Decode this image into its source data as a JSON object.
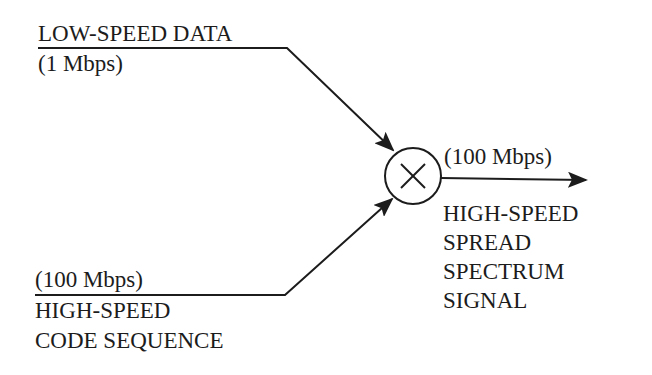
{
  "diagram": {
    "inputs": [
      {
        "id": "data",
        "label": "LOW-SPEED DATA",
        "rate": "(1 Mbps)"
      },
      {
        "id": "code",
        "rate": "(100 Mbps)",
        "label_lines": [
          "HIGH-SPEED",
          "CODE SEQUENCE"
        ]
      }
    ],
    "operator": {
      "symbol": "×",
      "name": "multiplier"
    },
    "output": {
      "rate": "(100 Mbps)",
      "label_lines": [
        "HIGH-SPEED",
        "SPREAD",
        "SPECTRUM",
        "SIGNAL"
      ]
    },
    "colors": {
      "ink": "#1c1c1c",
      "background": "#ffffff"
    }
  }
}
